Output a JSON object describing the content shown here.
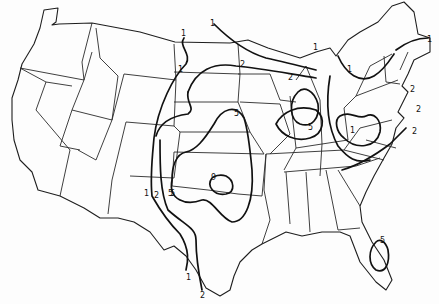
{
  "map": {
    "subject": "Contiguous United States with state boundaries and labeled isolines",
    "background_color": "#ffffff",
    "line_color": "#111111",
    "contour_levels": [
      "1",
      "2",
      "5",
      "9"
    ],
    "labels": [
      {
        "id": "lbl-1-montana",
        "text": "1"
      },
      {
        "id": "lbl-1-ndakota",
        "text": "1"
      },
      {
        "id": "lbl-1-minnesota",
        "text": "1"
      },
      {
        "id": "lbl-2-minnesota",
        "text": "2"
      },
      {
        "id": "lbl-1-upper-michigan",
        "text": "1"
      },
      {
        "id": "lbl-2-michigan",
        "text": "2"
      },
      {
        "id": "lbl-5-iowa",
        "text": "5"
      },
      {
        "id": "lbl-5-indiana",
        "text": "5"
      },
      {
        "id": "lbl-5-kansas",
        "text": "5"
      },
      {
        "id": "lbl-9-oklahoma",
        "text": "9"
      },
      {
        "id": "lbl-1-newmexico",
        "text": "1"
      },
      {
        "id": "lbl-2-newmexico",
        "text": "2"
      },
      {
        "id": "lbl-5-newmexico",
        "text": "5"
      },
      {
        "id": "lbl-1-texas",
        "text": "1"
      },
      {
        "id": "lbl-2-texas",
        "text": "2"
      },
      {
        "id": "lbl-1-newengland",
        "text": "1"
      },
      {
        "id": "lbl-1-pennsylvania",
        "text": "1"
      },
      {
        "id": "lbl-2-ct",
        "text": "2"
      },
      {
        "id": "lbl-2-nj",
        "text": "2"
      },
      {
        "id": "lbl-2-virginia",
        "text": "2"
      },
      {
        "id": "lbl-1-westvirginia",
        "text": "1"
      },
      {
        "id": "lbl-5-florida",
        "text": "5"
      }
    ]
  }
}
